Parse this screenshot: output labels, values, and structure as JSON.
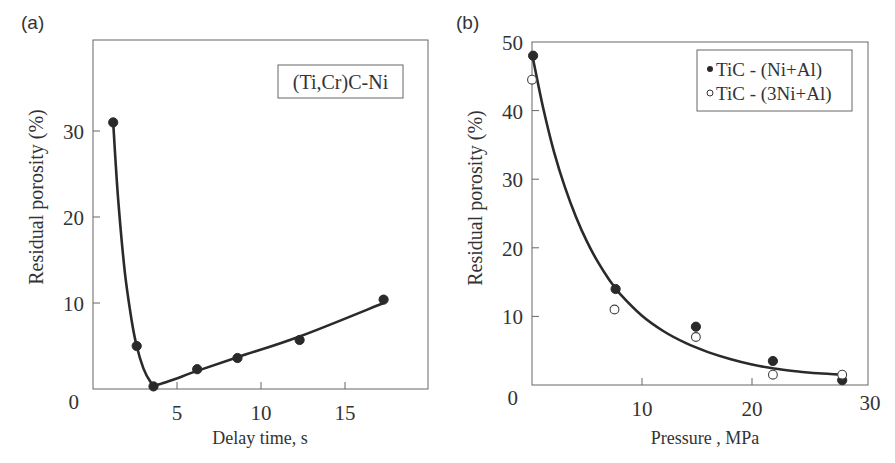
{
  "panels": {
    "a": {
      "label": "(a)"
    },
    "b": {
      "label": "(b)"
    }
  },
  "chart_data": [
    {
      "id": "a",
      "type": "line",
      "title": "",
      "annotation": "(Ti,Cr)C-Ni",
      "xlabel": "Delay time, s",
      "ylabel": "Residual porosity  (%)",
      "xlim": [
        0,
        20
      ],
      "ylim": [
        0,
        40
      ],
      "xticks": [
        5,
        10,
        15
      ],
      "yticks": [
        10,
        20,
        30
      ],
      "origin_label": "0",
      "grid": false,
      "legend": null,
      "series": [
        {
          "name": "(Ti,Cr)C-Ni",
          "marker": "filled-circle",
          "x": [
            1.2,
            2.6,
            3.6,
            6.2,
            8.6,
            12.3,
            17.3
          ],
          "y": [
            31.0,
            5.0,
            0.3,
            2.3,
            3.6,
            5.7,
            10.4
          ]
        }
      ],
      "fit_curve": {
        "x": [
          1.2,
          1.5,
          1.9,
          2.3,
          2.6,
          3.0,
          3.4,
          3.7,
          4.5,
          6.2,
          8.6,
          12.3,
          17.3
        ],
        "y": [
          31.0,
          22.0,
          13.5,
          8.0,
          5.0,
          2.4,
          0.9,
          0.45,
          0.9,
          2.1,
          3.7,
          6.1,
          10.0
        ]
      }
    },
    {
      "id": "b",
      "type": "scatter",
      "title": "",
      "xlabel": "Pressure , MPa",
      "ylabel": "Residual porosity  (%)",
      "xlim": [
        0,
        30.5
      ],
      "ylim": [
        0,
        50
      ],
      "xticks": [
        10,
        20
      ],
      "xtick_end_label": "30",
      "yticks": [
        10,
        20,
        30,
        40,
        50
      ],
      "origin_label": "0",
      "grid": false,
      "legend": {
        "position": "upper right",
        "entries": [
          "TiC - (Ni+Al)",
          "TiC - (3Ni+Al)"
        ]
      },
      "series": [
        {
          "name": "TiC - (Ni+Al)",
          "marker": "filled-circle",
          "x": [
            0.1,
            7.6,
            14.9,
            21.9,
            28.2
          ],
          "y": [
            48.0,
            14.0,
            8.5,
            3.5,
            0.7
          ]
        },
        {
          "name": "TiC - (3Ni+Al)",
          "marker": "open-circle",
          "x": [
            0.0,
            7.5,
            14.9,
            21.9,
            28.2
          ],
          "y": [
            44.5,
            11.0,
            7.0,
            1.5,
            1.5
          ]
        }
      ],
      "fit_curve": {
        "x": [
          0.1,
          1,
          2,
          3,
          4,
          5,
          6,
          7,
          8,
          10,
          12,
          14,
          16,
          18,
          20,
          22,
          24,
          26,
          28.2
        ],
        "y": [
          47.5,
          40.5,
          34.0,
          28.8,
          24.5,
          20.9,
          17.9,
          15.4,
          13.3,
          10.1,
          7.8,
          6.1,
          4.8,
          3.8,
          3.0,
          2.4,
          2.0,
          1.7,
          1.5
        ]
      }
    }
  ]
}
